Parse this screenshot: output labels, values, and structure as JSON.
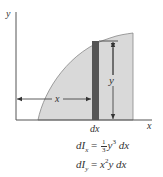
{
  "diagram": {
    "axes": {
      "x_label": "x",
      "y_label": "y"
    },
    "region": {
      "fill_color": "#d9d9d9",
      "outline_color": "#777777"
    },
    "strip": {
      "fill_color": "#555555",
      "width_label": "dx"
    },
    "dimensions": {
      "horizontal_label": "x",
      "vertical_label": "y"
    },
    "equations": {
      "line1": {
        "lhs": "dI",
        "lhs_sub": "x",
        "equals": "=",
        "frac_num": "1",
        "frac_den": "3",
        "var": "y",
        "power": "3",
        "tail": "dx"
      },
      "line2": {
        "lhs": "dI",
        "lhs_sub": "y",
        "equals": "=",
        "var1": "x",
        "power": "2",
        "var2": "y",
        "tail": "dx"
      }
    }
  }
}
